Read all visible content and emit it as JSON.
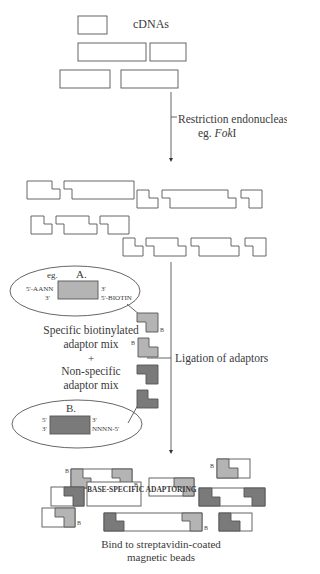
{
  "colors": {
    "line": "#555555",
    "fragment_fill": "#ffffff",
    "specific_adaptor": "#b4b4b4",
    "nonspecific_adaptor": "#7a7a7a",
    "arrow": "#555555"
  },
  "labels": {
    "cdnas": "cDNAs",
    "restriction_line1": "Restriction endonuclease",
    "restriction_line2_prefix": "eg. ",
    "restriction_enzyme": "Fok",
    "restriction_suffix": "I",
    "adaptor_a": {
      "eg": "eg.",
      "title": "A.",
      "left_top": "5'-AANN",
      "left_bottom": "3'",
      "right_top": "3'",
      "right_bottom": "5'-BIOTIN"
    },
    "specific_line1": "Specific biotinylated",
    "specific_line2": "adaptor mix",
    "plus": "+",
    "nonspecific_line1": "Non-specific",
    "nonspecific_line2": "adaptor mix",
    "adaptor_b": {
      "title": "B.",
      "left_top": "5'",
      "left_bottom": "3'",
      "right_top": "3'",
      "right_bottom": "NNNN-5'"
    },
    "ligation": "Ligation of adaptors",
    "base_specific": "BASE-SPECIFIC ADAPTORING",
    "bind_line1": "Bind to streptavidin-coated",
    "bind_line2": "magnetic beads",
    "biotin_marker": "B"
  },
  "steps": [
    {
      "id": "cdnas",
      "label": "cDNAs"
    },
    {
      "id": "restriction",
      "label": "Restriction endonuclease eg. FokI"
    },
    {
      "id": "ligation",
      "label": "Ligation of adaptors"
    },
    {
      "id": "bind",
      "label": "Bind to streptavidin-coated magnetic beads"
    }
  ]
}
